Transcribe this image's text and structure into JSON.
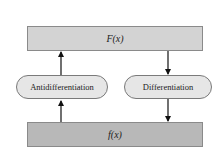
{
  "diagram": {
    "top_box": {
      "label": "F(x)"
    },
    "bottom_box": {
      "label": "f(x)"
    },
    "left_process": {
      "label": "Antidifferentiation",
      "direction": "up"
    },
    "right_process": {
      "label": "Differentiation",
      "direction": "down"
    }
  },
  "colors": {
    "top_box_fill": "#d3d3d3",
    "bottom_box_fill": "#b8b8b8",
    "pill_fill": "#e6e6e6",
    "arrow": "#111111"
  }
}
